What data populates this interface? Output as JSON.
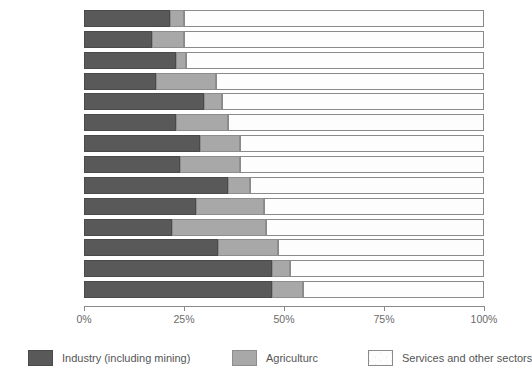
{
  "chart_data": {
    "type": "bar",
    "orientation": "horizontal",
    "stacked": true,
    "normalized": true,
    "title": "",
    "subtitle": "",
    "xlabel": "",
    "ylabel": "",
    "xlim": [
      0,
      100
    ],
    "grid": false,
    "legend_position": "bottom",
    "tick_labels": [
      "0%",
      "25%",
      "50%",
      "75%",
      "100%"
    ],
    "tick_values": [
      0,
      25,
      50,
      75,
      100
    ],
    "categories": [
      "Italy",
      "Lebanon",
      "France",
      "Greece",
      "Spain",
      "Tunisia",
      "Algeria",
      "Egypt",
      "Libya",
      "Morocco",
      "Syria",
      "Turkey",
      "Israel",
      "Yugoslavia"
    ],
    "series": [
      {
        "name": "Industry (including mining)",
        "color": "#595959",
        "values": [
          21.5,
          17.0,
          23.0,
          18.0,
          30.0,
          23.0,
          29.0,
          24.0,
          36.0,
          28.0,
          22.0,
          33.5,
          47.0,
          47.0
        ]
      },
      {
        "name": "Agriculturc",
        "color": "#a8a8a8",
        "values": [
          3.5,
          8.0,
          2.5,
          15.0,
          4.5,
          13.0,
          10.0,
          15.0,
          5.5,
          17.0,
          23.5,
          15.0,
          4.5,
          7.75
        ]
      },
      {
        "name": "Services and other sectors",
        "color": "#fdfdfd",
        "values": [
          75.0,
          75.0,
          74.5,
          67.0,
          65.5,
          64.0,
          61.0,
          61.0,
          58.5,
          55.0,
          54.5,
          51.5,
          48.5,
          45.25
        ]
      }
    ]
  },
  "legend": {
    "items": [
      {
        "label": "Industry (including mining)",
        "swatch": "industry-swatch"
      },
      {
        "label": "Agriculturc",
        "swatch": "agriculture-swatch"
      },
      {
        "label": "Services and other sectors",
        "swatch": "services-swatch"
      }
    ]
  },
  "colors": {
    "industry": "#595959",
    "agriculture": "#a8a8a8",
    "services": "#fdfdfd",
    "outline": "#6e6e6e",
    "text": "#555555",
    "axis": "#8a8a8a"
  }
}
